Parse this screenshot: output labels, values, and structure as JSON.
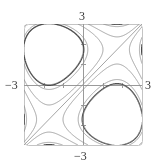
{
  "chart_data": {
    "type": "line",
    "title": "",
    "xlabel": "",
    "ylabel": "",
    "xlim": [
      -3,
      3
    ],
    "ylim": [
      -3,
      3
    ],
    "tick_labels": {
      "top": "3",
      "bottom": "−3",
      "left": "−3",
      "right": "3"
    },
    "ticks": {
      "x": [
        -2,
        -1,
        1,
        2
      ],
      "y": [
        -2,
        -1,
        1,
        2
      ]
    },
    "grid": false,
    "legend": null,
    "levels": [
      -10.3,
      -10.0,
      -8.2,
      -2.3,
      0,
      2.3,
      8.2,
      10.0,
      10.3
    ],
    "emphasized_levels": [
      -10.0,
      10.0
    ],
    "colors": {
      "curve": "#8a8a8a",
      "emphasized": "#4a4a4a",
      "axis": "#9a9a9a",
      "frame": "#c4c4c4",
      "diagonal": "#9a9a9a"
    },
    "frame_px": {
      "left": 24,
      "top": 24,
      "right": 142,
      "bottom": 145
    }
  }
}
